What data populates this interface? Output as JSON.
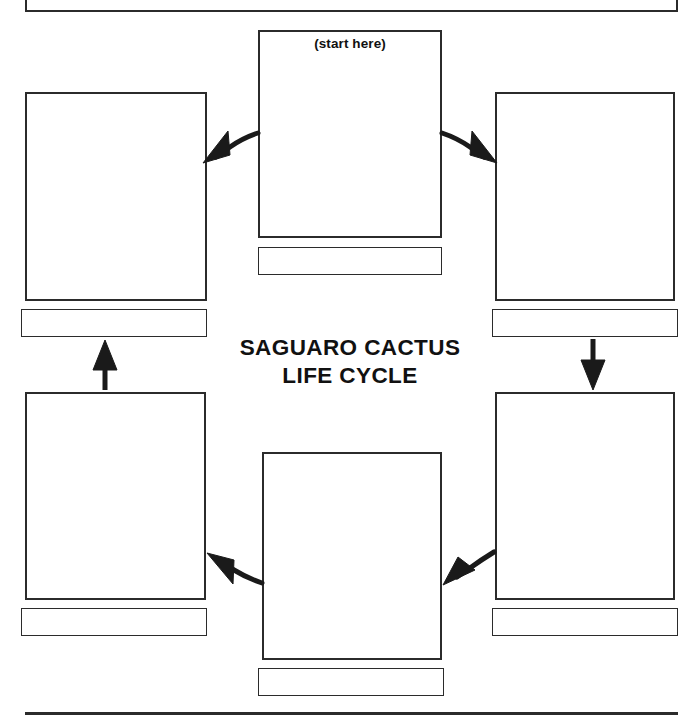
{
  "worksheet": {
    "title_lines": [
      "SAGUARO CACTUS",
      "LIFE CYCLE"
    ],
    "start_marker": "(start here)"
  },
  "boxes": [
    {
      "id": "top-center",
      "name": "stage-1-picture-box",
      "note": "(start here)",
      "caption": ""
    },
    {
      "id": "right-top",
      "name": "stage-2-picture-box",
      "note": "",
      "caption": ""
    },
    {
      "id": "right-bottom",
      "name": "stage-3-picture-box",
      "note": "",
      "caption": ""
    },
    {
      "id": "bottom-center",
      "name": "stage-4-picture-box",
      "note": "",
      "caption": ""
    },
    {
      "id": "left-bottom",
      "name": "stage-5-picture-box",
      "note": "",
      "caption": ""
    },
    {
      "id": "left-top",
      "name": "stage-6-picture-box",
      "note": "",
      "caption": ""
    }
  ],
  "labels": {
    "top_center": "",
    "left_top": "",
    "right_top": "",
    "left_bottom": "",
    "right_bottom": "",
    "bottom_center": ""
  },
  "arrows": [
    {
      "name": "arrow-start-to-left-top",
      "direction": "up-left"
    },
    {
      "name": "arrow-start-to-right-top",
      "direction": "down-right"
    },
    {
      "name": "arrow-left-bottom-to-left-top",
      "direction": "up"
    },
    {
      "name": "arrow-right-top-to-right-bottom",
      "direction": "down"
    },
    {
      "name": "arrow-bottom-center-to-left-bottom",
      "direction": "up-left"
    },
    {
      "name": "arrow-right-bottom-to-bottom-center",
      "direction": "down-left"
    }
  ],
  "colors": {
    "ink": "#2b2b2b",
    "text": "#111111",
    "paper": "#ffffff"
  }
}
